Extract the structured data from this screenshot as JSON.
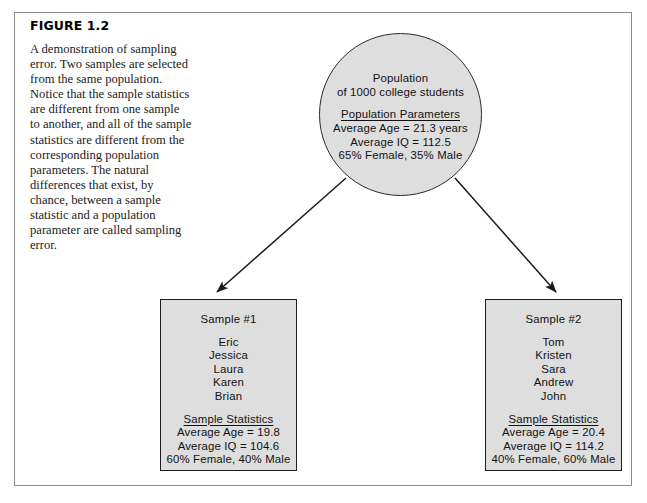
{
  "figure": {
    "label": "FIGURE 1.2",
    "caption": "A demonstration of sampling error. Two samples are selected from the same population. Notice that the sample statistics are different from one sample to another, and all of the sample statistics are different from the corresponding population parameters. The natural differences that exist, by chance, between a sample statistic and a population parameter are called sampling error."
  },
  "population": {
    "line1": "Population",
    "line2": "of 1000 college students",
    "parameters_heading": "Population Parameters",
    "parameters": [
      "Average Age = 21.3 years",
      "Average IQ = 112.5",
      "65% Female, 35% Male"
    ]
  },
  "samples": [
    {
      "title": "Sample #1",
      "names": [
        "Eric",
        "Jessica",
        "Laura",
        "Karen",
        "Brian"
      ],
      "statistics_heading": "Sample Statistics",
      "statistics": [
        "Average Age = 19.8",
        "Average IQ = 104.6",
        "60% Female, 40% Male"
      ]
    },
    {
      "title": "Sample #2",
      "names": [
        "Tom",
        "Kristen",
        "Sara",
        "Andrew",
        "John"
      ],
      "statistics_heading": "Sample Statistics",
      "statistics": [
        "Average Age = 20.4",
        "Average IQ = 114.2",
        "40% Female, 60% Male"
      ]
    }
  ],
  "colors": {
    "shape_fill": "#dedede",
    "shape_stroke": "#1d1d1d",
    "frame_stroke": "#8c8c8c",
    "arrow_stroke": "#1a1a1a",
    "page_background": "#ffffff"
  },
  "arrows": [
    {
      "name": "arrow-to-sample-1",
      "from": "population-circle",
      "to": "sample-box-1"
    },
    {
      "name": "arrow-to-sample-2",
      "from": "population-circle",
      "to": "sample-box-2"
    }
  ]
}
